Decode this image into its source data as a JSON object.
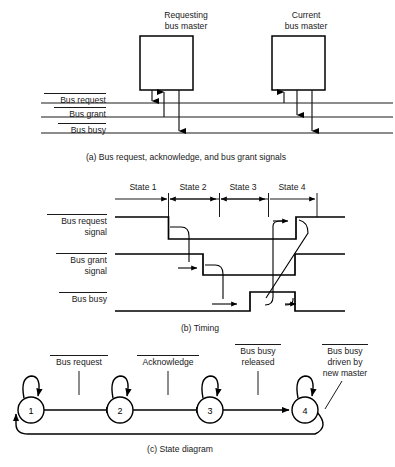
{
  "figure": {
    "title_implicit": "Bus arbitration signals, timing, and state diagram",
    "panels": [
      {
        "id": "a",
        "caption": "(a) Bus request, acknowledge, and bus grant signals",
        "blocks": [
          {
            "name": "requesting-bus-master",
            "line1": "Requesting",
            "line2": "bus master"
          },
          {
            "name": "current-bus-master",
            "line1": "Current",
            "line2": "bus master"
          }
        ],
        "bus_lines": [
          {
            "name": "bus-request",
            "label": "Bus request",
            "overline": true
          },
          {
            "name": "bus-grant",
            "label": "Bus grant",
            "overline": true
          },
          {
            "name": "bus-busy",
            "label": "Bus busy",
            "overline": true
          }
        ]
      },
      {
        "id": "b",
        "caption": "(b) Timing",
        "states": [
          "State 1",
          "State 2",
          "State 3",
          "State 4"
        ],
        "signals": [
          {
            "name": "bus-request-signal",
            "label_line1": "Bus request",
            "label_line2": "signal",
            "overline": true
          },
          {
            "name": "bus-grant-signal",
            "label_line1": "Bus grant",
            "label_line2": "signal",
            "overline": true
          },
          {
            "name": "bus-busy-signal",
            "label_line1": "Bus busy",
            "label_line2": "",
            "overline": true
          }
        ]
      },
      {
        "id": "c",
        "caption": "(c) State diagram",
        "nodes": [
          "1",
          "2",
          "3",
          "4"
        ],
        "transitions": [
          {
            "name": "transition-bus-request",
            "lines": [
              "Bus request"
            ],
            "overline": true
          },
          {
            "name": "transition-acknowledge",
            "lines": [
              "Acknowledge"
            ],
            "overline": true
          },
          {
            "name": "transition-bus-busy-released",
            "lines": [
              "Bus busy",
              "released"
            ],
            "overline": true
          },
          {
            "name": "transition-bus-busy-driven",
            "lines": [
              "Bus busy",
              "driven by",
              "new master"
            ],
            "overline": true
          }
        ]
      }
    ]
  },
  "colors": {
    "ink": "#1a1a1a",
    "line": "#000000",
    "background": "#ffffff"
  }
}
